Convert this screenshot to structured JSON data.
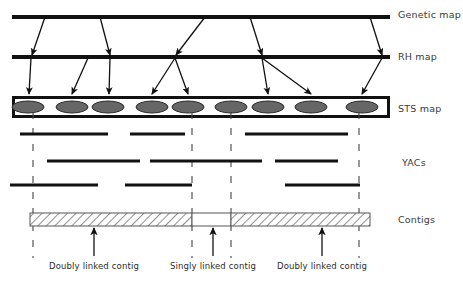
{
  "figure": {
    "width": 463,
    "height": 284,
    "background": "#ffffff",
    "ink_color": "#111111",
    "marker_fill": "#666666",
    "hatch_color": "#555555",
    "dash_color": "#444444"
  },
  "row_labels": [
    {
      "key": "genetic_map",
      "text": "Genetic map",
      "x": 398,
      "y": 9
    },
    {
      "key": "rh_map",
      "text": "RH map",
      "x": 398,
      "y": 51
    },
    {
      "key": "sts_map",
      "text": "STS map",
      "x": 398,
      "y": 103
    },
    {
      "key": "yacs",
      "text": "YACs",
      "x": 402,
      "y": 157
    },
    {
      "key": "contigs",
      "text": "Contigs",
      "x": 398,
      "y": 214
    }
  ],
  "tracks": {
    "genetic_map": {
      "x1": 12,
      "x2": 390,
      "y": 17,
      "thickness": 4
    },
    "rh_map": {
      "x1": 12,
      "x2": 390,
      "y": 57,
      "thickness": 4
    },
    "sts_map": {
      "x": 12,
      "y": 96,
      "width": 378,
      "height": 22,
      "border": 3,
      "markers_cx": [
        28,
        72,
        108,
        152,
        188,
        231,
        268,
        311,
        362
      ],
      "marker_rx": 16,
      "marker_ry": 6,
      "marker_cy": 107
    },
    "contigs": {
      "x": 30,
      "y": 213,
      "width": 340,
      "height": 13,
      "segments": [
        {
          "name": "doubly-linked-left",
          "x": 30,
          "width": 162,
          "fill": "hatch"
        },
        {
          "name": "singly-linked-gap",
          "x": 192,
          "width": 39,
          "fill": "white"
        },
        {
          "name": "doubly-linked-right",
          "x": 231,
          "width": 139,
          "fill": "hatch"
        }
      ]
    }
  },
  "genetic_to_rh_arrows": [
    {
      "x1": 45,
      "y1": 17,
      "x2": 32,
      "y2": 55
    },
    {
      "x1": 100,
      "y1": 17,
      "x2": 110,
      "y2": 55
    },
    {
      "x1": 205,
      "y1": 17,
      "x2": 176,
      "y2": 55
    },
    {
      "x1": 250,
      "y1": 17,
      "x2": 262,
      "y2": 55
    },
    {
      "x1": 370,
      "y1": 17,
      "x2": 382,
      "y2": 55
    }
  ],
  "rh_to_sts_arrows": [
    {
      "x1": 31,
      "y1": 58,
      "x2": 29,
      "y2": 94
    },
    {
      "x1": 88,
      "y1": 58,
      "x2": 72,
      "y2": 94
    },
    {
      "x1": 110,
      "y1": 58,
      "x2": 109,
      "y2": 94
    },
    {
      "x1": 175,
      "y1": 58,
      "x2": 152,
      "y2": 94
    },
    {
      "x1": 175,
      "y1": 58,
      "x2": 188,
      "y2": 94
    },
    {
      "x1": 262,
      "y1": 58,
      "x2": 268,
      "y2": 94
    },
    {
      "x1": 262,
      "y1": 58,
      "x2": 311,
      "y2": 94
    },
    {
      "x1": 382,
      "y1": 58,
      "x2": 362,
      "y2": 94
    }
  ],
  "dashed_guides": [
    {
      "x": 33,
      "y1": 112,
      "y2": 258
    },
    {
      "x": 192,
      "y1": 112,
      "y2": 258
    },
    {
      "x": 231,
      "y1": 112,
      "y2": 258
    },
    {
      "x": 359,
      "y1": 112,
      "y2": 258
    }
  ],
  "yac_rows": [
    {
      "row": 1,
      "y": 134,
      "bars": [
        {
          "x1": 20,
          "x2": 108
        },
        {
          "x1": 130,
          "x2": 185
        },
        {
          "x1": 245,
          "x2": 348
        }
      ]
    },
    {
      "row": 2,
      "y": 161,
      "bars": [
        {
          "x1": 47,
          "x2": 140
        },
        {
          "x1": 150,
          "x2": 262
        },
        {
          "x1": 275,
          "x2": 338
        }
      ]
    },
    {
      "row": 3,
      "y": 185,
      "bars": [
        {
          "x1": 10,
          "x2": 98
        },
        {
          "x1": 125,
          "x2": 192
        },
        {
          "x1": 285,
          "x2": 360
        }
      ]
    }
  ],
  "contig_callouts": [
    {
      "key": "doubly-left",
      "label": "Doubly linked contig",
      "arrow_x": 94,
      "arrow_top": 228,
      "arrow_bottom": 256,
      "label_cx": 94,
      "label_y": 261
    },
    {
      "key": "singly",
      "label": "Singly linked contig",
      "arrow_x": 213,
      "arrow_top": 228,
      "arrow_bottom": 256,
      "label_cx": 213,
      "label_y": 261
    },
    {
      "key": "doubly-right",
      "label": "Doubly linked contig",
      "arrow_x": 322,
      "arrow_top": 228,
      "arrow_bottom": 256,
      "label_cx": 322,
      "label_y": 261
    }
  ]
}
